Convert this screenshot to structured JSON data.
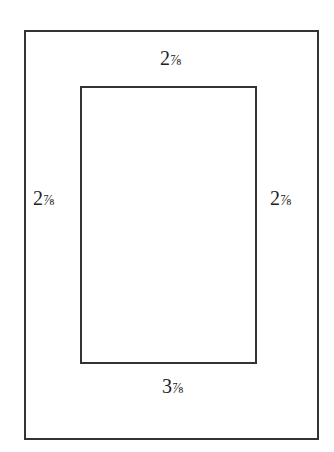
{
  "diagram": {
    "outer_frame": {
      "label": "outer-frame"
    },
    "inner_opening": {
      "label": "inner-opening"
    },
    "measurements": {
      "top": {
        "whole": "2",
        "fraction": "⅞",
        "value": "2 7/8"
      },
      "left": {
        "whole": "2",
        "fraction": "⅞",
        "value": "2 7/8"
      },
      "right": {
        "whole": "2",
        "fraction": "⅞",
        "value": "2 7/8"
      },
      "bottom": {
        "whole": "3",
        "fraction": "⅞",
        "value": "3 7/8"
      }
    },
    "line_color": "#333333"
  }
}
